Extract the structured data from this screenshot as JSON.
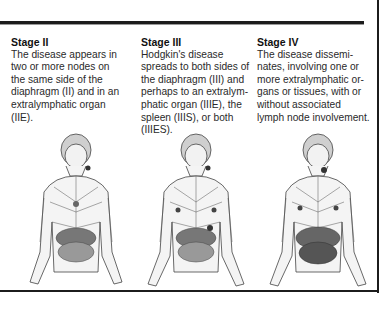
{
  "stages": [
    {
      "title": "Stage II",
      "description_lines": [
        "The disease appears in",
        "two or more nodes on",
        "the same side of the",
        "diaphragm (II) and in an",
        "extralymphatic organ",
        "(IIE)."
      ],
      "figure": "lymphatic-system-figure-stage-2"
    },
    {
      "title": "Stage III",
      "description_lines": [
        "Hodgkin's disease",
        "spreads to both sides of",
        "the diaphragm (III) and",
        "perhaps to an extralym-",
        "phatic organ (IIIE), the",
        "spleen (IIIS), or both",
        "(IIIES)."
      ],
      "figure": "lymphatic-system-figure-stage-3"
    },
    {
      "title": "Stage IV",
      "description_lines": [
        "The disease dissemi-",
        "nates, involving one or",
        "more extralymphatic or-",
        "gans or tissues, with or",
        "without associated",
        "lymph node involvement."
      ],
      "figure": "lymphatic-system-figure-stage-4"
    }
  ],
  "colors": {
    "rule": "#1c1c1c",
    "text": "#2a2a2a",
    "figure_ink": "#3a3a3a",
    "figure_fill": "#e9e9e9"
  }
}
